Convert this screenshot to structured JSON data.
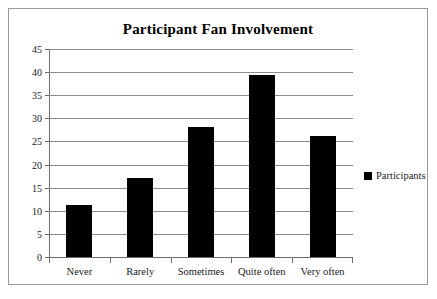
{
  "chart_data": {
    "type": "bar",
    "title": "Participant Fan Involvement",
    "xlabel": "",
    "ylabel": "",
    "categories": [
      "Never",
      "Rarely",
      "Sometimes",
      "Quite often",
      "Very often"
    ],
    "series": [
      {
        "name": "Participants",
        "values": [
          11.2,
          17.2,
          28.2,
          39.4,
          26.2
        ],
        "color": "#000000"
      }
    ],
    "ylim": [
      0,
      45
    ],
    "ytick_step": 5,
    "yticks": [
      0,
      5,
      10,
      15,
      20,
      25,
      30,
      35,
      40,
      45
    ],
    "ytick_labels": [
      "0",
      "5",
      "10",
      "15",
      "20",
      "25",
      "30",
      "35",
      "40",
      "45"
    ],
    "grid": true,
    "grid_axis": "y",
    "legend": {
      "position": "right",
      "entries": [
        {
          "label": "Participants",
          "marker": "square",
          "color": "#000000"
        }
      ]
    },
    "border": true,
    "background": "#ffffff",
    "axis_color": "#6b6b6b",
    "grid_color": "#8c8c8c"
  }
}
